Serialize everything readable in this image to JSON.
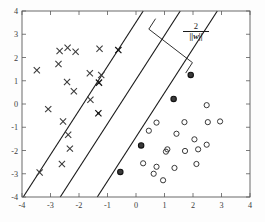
{
  "figure": {
    "title": "",
    "annotation_margin_numerator": "2",
    "annotation_margin_denominator": "||w||"
  },
  "chart_data": {
    "type": "scatter",
    "title": "",
    "xlabel": "",
    "ylabel": "",
    "xlim": [
      -4,
      4
    ],
    "ylim": [
      -4,
      4
    ],
    "grid": false,
    "legend": null,
    "xticks": [
      -4,
      -3,
      -2,
      -1,
      0,
      1,
      2,
      3,
      4
    ],
    "yticks": [
      -4,
      -3,
      -2,
      -1,
      0,
      1,
      2,
      3,
      4
    ],
    "xticklabels": [
      "-4",
      "-3",
      "-2",
      "-1",
      "0",
      "1",
      "2",
      "3",
      "4"
    ],
    "yticklabels": [
      "-4",
      "-3",
      "-2",
      "-1",
      "0",
      "1",
      "2",
      "3",
      "4"
    ],
    "series": [
      {
        "name": "class-negative-x",
        "marker": "x",
        "color": "#3a3a3a",
        "points": [
          [
            -3.48,
            1.45
          ],
          [
            -3.08,
            -0.22
          ],
          [
            -2.68,
            2.28
          ],
          [
            -2.72,
            1.72
          ],
          [
            -2.56,
            -0.75
          ],
          [
            -2.6,
            -2.58
          ],
          [
            -2.4,
            2.42
          ],
          [
            -2.42,
            0.95
          ],
          [
            -2.38,
            -1.32
          ],
          [
            -2.12,
            2.25
          ],
          [
            -2.18,
            0.55
          ],
          [
            -2.32,
            -1.92
          ],
          [
            -1.62,
            1.32
          ],
          [
            -1.6,
            0.18
          ],
          [
            -1.28,
            2.38
          ],
          [
            -1.22,
            1.25
          ],
          [
            -3.38,
            -2.95
          ]
        ]
      },
      {
        "name": "class-positive-o",
        "marker": "o",
        "color": "#2e2e2e",
        "points": [
          [
            0.72,
            -0.8
          ],
          [
            0.45,
            -1.15
          ],
          [
            0.72,
            -2.7
          ],
          [
            0.25,
            -2.55
          ],
          [
            0.62,
            -3.0
          ],
          [
            0.95,
            -3.28
          ],
          [
            1.1,
            -1.95
          ],
          [
            1.42,
            -1.28
          ],
          [
            1.35,
            -2.75
          ],
          [
            1.72,
            -2.02
          ],
          [
            1.7,
            -0.78
          ],
          [
            2.05,
            -1.52
          ],
          [
            2.18,
            -1.95
          ],
          [
            2.12,
            -2.58
          ],
          [
            2.48,
            -0.05
          ],
          [
            2.52,
            -0.78
          ],
          [
            2.95,
            -0.75
          ],
          [
            2.48,
            -1.75
          ],
          [
            1.05,
            -2.05
          ]
        ]
      },
      {
        "name": "support-vectors-positive",
        "marker": "filled-o",
        "color": "#3a3a3a",
        "points": [
          [
            -0.55,
            -2.92
          ],
          [
            0.18,
            -1.78
          ],
          [
            1.32,
            0.22
          ],
          [
            1.92,
            1.25
          ]
        ]
      },
      {
        "name": "support-vectors-negative",
        "marker": "filled-x",
        "color": "#1a1a1a",
        "points": [
          [
            -1.32,
            -0.4
          ],
          [
            -1.3,
            0.92
          ],
          [
            -0.62,
            2.32
          ]
        ]
      }
    ],
    "lines": [
      {
        "name": "margin-line-negative",
        "label": "w.x + b = +1",
        "slope": 1.9,
        "intercept": 3.52,
        "style": "solid"
      },
      {
        "name": "decision-boundary",
        "label": "w.x + b = 0",
        "slope": 1.9,
        "intercept": 1.05,
        "style": "solid"
      },
      {
        "name": "margin-line-positive",
        "label": "w.x + b = -1",
        "slope": 1.9,
        "intercept": -1.42,
        "style": "solid"
      }
    ],
    "annotations": [
      {
        "name": "margin-width-label",
        "text": "2 / ||w||",
        "x": 1.72,
        "y": 2.72,
        "description": "maximum margin width between the two margin hyperplanes"
      },
      {
        "name": "margin-bracket",
        "description": "perpendicular bracket spanning the margin",
        "from": [
          0.45,
          3.22
        ],
        "to": [
          1.98,
          1.78
        ]
      }
    ]
  }
}
